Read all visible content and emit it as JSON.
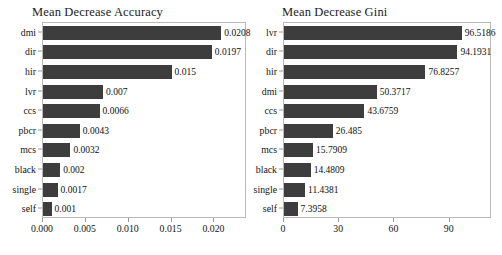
{
  "figure": {
    "width": 502,
    "height": 255,
    "background": "#ffffff",
    "bar_color": "#3d3d3d",
    "frame_color": "#b9b9b9"
  },
  "chart_data": [
    {
      "type": "bar",
      "orientation": "horizontal",
      "title": "Mean Decrease Accuracy",
      "xlabel": "",
      "ylabel": "",
      "grid": false,
      "legend": null,
      "xlim": [
        0,
        0.0238
      ],
      "xticks": [
        0,
        0.005,
        0.01,
        0.015,
        0.02
      ],
      "xtick_labels": [
        "0.000",
        "0.005",
        "0.010",
        "0.015",
        "0.020"
      ],
      "categories": [
        "dmi",
        "dir",
        "hir",
        "lvr",
        "ccs",
        "pbcr",
        "mcs",
        "black",
        "single",
        "self"
      ],
      "values": [
        0.0208,
        0.0197,
        0.015,
        0.007,
        0.0066,
        0.0043,
        0.0032,
        0.002,
        0.0017,
        0.001
      ],
      "value_labels": [
        "0.0208",
        "0.0197",
        "0.015",
        "0.007",
        "0.0066",
        "0.0043",
        "0.0032",
        "0.002",
        "0.0017",
        "0.001"
      ]
    },
    {
      "type": "bar",
      "orientation": "horizontal",
      "title": "Mean Decrease Gini",
      "xlabel": "",
      "ylabel": "",
      "grid": false,
      "legend": null,
      "xlim": [
        0,
        113
      ],
      "xticks": [
        0,
        30,
        60,
        90
      ],
      "xtick_labels": [
        "0",
        "30",
        "60",
        "90"
      ],
      "categories": [
        "lvr",
        "dir",
        "hir",
        "dmi",
        "ccs",
        "pbcr",
        "mcs",
        "black",
        "single",
        "self"
      ],
      "values": [
        96.5186,
        94.1931,
        76.8257,
        50.3717,
        43.6759,
        26.485,
        15.7909,
        14.4809,
        11.4381,
        7.3958
      ],
      "value_labels": [
        "96.5186",
        "94.1931",
        "76.8257",
        "50.3717",
        "43.6759",
        "26.485",
        "15.7909",
        "14.4809",
        "11.4381",
        "7.3958"
      ]
    }
  ]
}
